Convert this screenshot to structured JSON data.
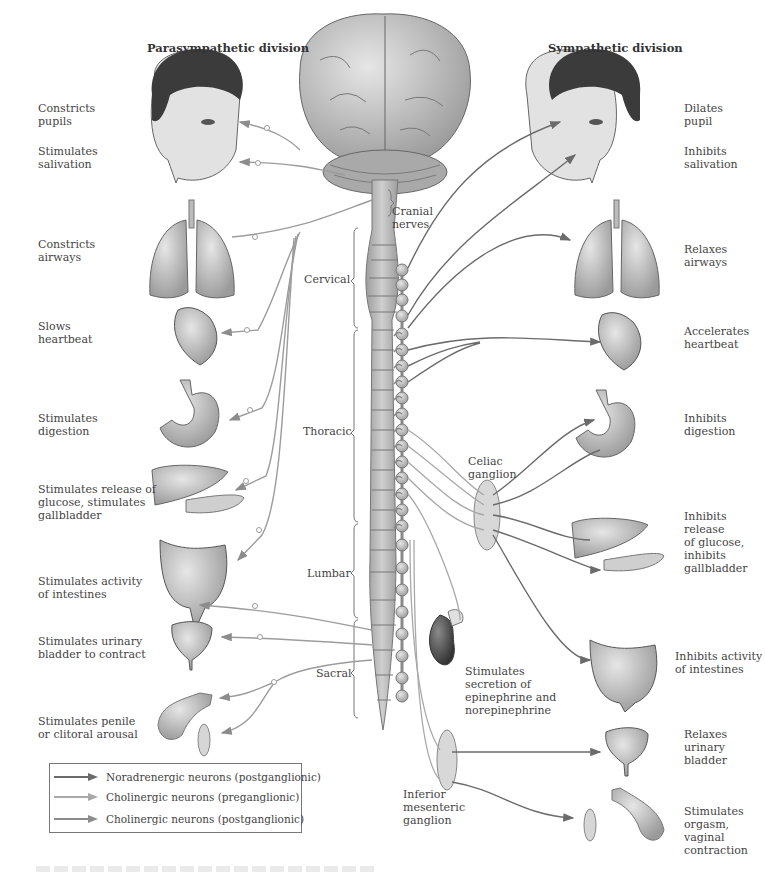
{
  "headings": {
    "parasympathetic": "Parasympathetic division",
    "sympathetic": "Sympathetic division"
  },
  "colors": {
    "noradrenergic_post": "#6b6b6b",
    "cholinergic_pre": "#a8a8a8",
    "cholinergic_post": "#8c8c8c",
    "organ_fill": "#c9c9c9",
    "organ_dark": "#5a5a5a",
    "ganglion_fill": "#d8d8d8"
  },
  "parasympathetic_effects": [
    {
      "organ": "eye",
      "label": "Constricts\npupils"
    },
    {
      "organ": "salivary-glands",
      "label": "Stimulates\nsalivation"
    },
    {
      "organ": "lungs",
      "label": "Constricts\nairways"
    },
    {
      "organ": "heart",
      "label": "Slows\nheartbeat"
    },
    {
      "organ": "stomach",
      "label": "Stimulates\ndigestion"
    },
    {
      "organ": "liver-pancreas",
      "label": "Stimulates release of\nglucose, stimulates\ngallbladder"
    },
    {
      "organ": "intestines",
      "label": "Stimulates activity\nof intestines"
    },
    {
      "organ": "bladder",
      "label": "Stimulates urinary\nbladder to contract"
    },
    {
      "organ": "genitals",
      "label": "Stimulates penile\nor clitoral arousal"
    }
  ],
  "sympathetic_effects": [
    {
      "organ": "eye",
      "label": "Dilates\npupil"
    },
    {
      "organ": "salivary-glands",
      "label": "Inhibits\nsalivation"
    },
    {
      "organ": "lungs",
      "label": "Relaxes\nairways"
    },
    {
      "organ": "heart",
      "label": "Accelerates\nheartbeat"
    },
    {
      "organ": "stomach",
      "label": "Inhibits\ndigestion"
    },
    {
      "organ": "liver-pancreas",
      "label": "Inhibits\nrelease\nof glucose,\ninhibits\ngallbladder"
    },
    {
      "organ": "intestines",
      "label": "Inhibits activity\nof intestines"
    },
    {
      "organ": "adrenal",
      "label": "Stimulates\nsecretion of\nepinephrine and\nnorepinephrine"
    },
    {
      "organ": "bladder",
      "label": "Relaxes\nurinary\nbladder"
    },
    {
      "organ": "genitals",
      "label": "Stimulates\norgasm,\nvaginal\ncontraction"
    }
  ],
  "spinal_regions": {
    "cranial": "Cranial\nnerves",
    "cervical": "Cervical",
    "thoracic": "Thoracic",
    "lumbar": "Lumbar",
    "sacral": "Sacral"
  },
  "ganglia": {
    "celiac": "Celiac\nganglion",
    "inferior_mesenteric": "Inferior\nmesenteric\nganglion"
  },
  "legend": [
    {
      "label": "Noradrenergic neurons (postganglionic)",
      "color_key": "noradrenergic_post"
    },
    {
      "label": "Cholinergic neurons (preganglionic)",
      "color_key": "cholinergic_pre"
    },
    {
      "label": "Cholinergic neurons (postganglionic)",
      "color_key": "cholinergic_post"
    }
  ]
}
